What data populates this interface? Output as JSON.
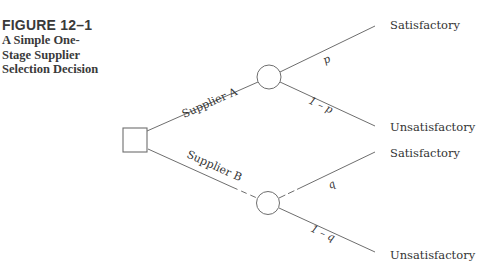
{
  "figure": {
    "number": "FIGURE 12–1",
    "title": "A Simple One-Stage Supplier Selection Decision"
  },
  "colors": {
    "line": "#6e6e6e",
    "text": "#333333",
    "caption": "#3a3a3a"
  },
  "tree": {
    "decision_node": {
      "type": "square",
      "x": 123,
      "y": 128,
      "size": 24
    },
    "branches": [
      {
        "label": "Supplier A",
        "chance_node": {
          "cx": 269,
          "cy": 77,
          "r": 12
        },
        "outcomes": [
          {
            "probability": "p",
            "label": "Satisfactory"
          },
          {
            "probability": "1 – p",
            "label": "Unsatisfactory"
          }
        ]
      },
      {
        "label": "Supplier B",
        "chance_node": {
          "cx": 268,
          "cy": 203,
          "r": 11.5
        },
        "outcomes": [
          {
            "probability": "q",
            "label": "Satisfactory"
          },
          {
            "probability": "1 – q",
            "label": "Unsatisfactory"
          }
        ]
      }
    ]
  }
}
